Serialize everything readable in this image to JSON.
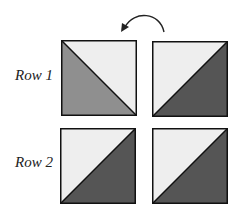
{
  "colors": {
    "light": "#eeeeee",
    "medium": "#8f8f8f",
    "dark": "#555555",
    "border": "#111111"
  },
  "arrow": {
    "icon": "curved-arrow-left-icon",
    "direction": "counterclockwise"
  },
  "rows": [
    {
      "label": "Row 1",
      "squares": [
        {
          "orientation": "diagonal-top-left-to-bottom-right",
          "upper_color": "light",
          "lower_color": "medium"
        },
        {
          "orientation": "diagonal-bottom-left-to-top-right",
          "upper_color": "light",
          "lower_color": "dark"
        }
      ]
    },
    {
      "label": "Row 2",
      "squares": [
        {
          "orientation": "diagonal-bottom-left-to-top-right",
          "upper_color": "light",
          "lower_color": "dark"
        },
        {
          "orientation": "diagonal-bottom-left-to-top-right",
          "upper_color": "light",
          "lower_color": "dark"
        }
      ]
    }
  ]
}
